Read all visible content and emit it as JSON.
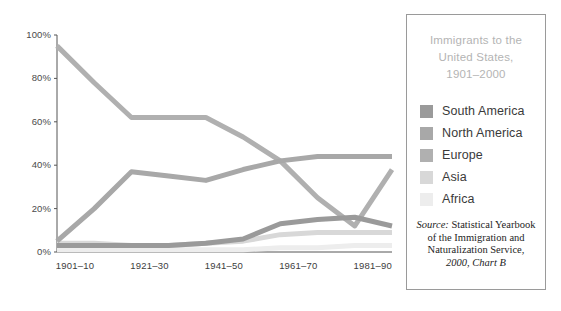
{
  "legend": {
    "title_lines": [
      "Immigrants to the",
      "United States,",
      "1901–2000"
    ],
    "source_prefix": "Source:",
    "source_lines": [
      " Statistical Yearbook",
      "of the Immigration and",
      "Naturalization Service,"
    ],
    "source_last_line": "2000, Chart B"
  },
  "chart_data": {
    "type": "line",
    "title": "Immigrants to the United States, 1901–2000",
    "xlabel": "",
    "ylabel": "",
    "ylim": [
      0,
      100
    ],
    "yticks": [
      "0%",
      "20%",
      "40%",
      "60%",
      "80%",
      "100%"
    ],
    "ytick_values": [
      0,
      20,
      40,
      60,
      80,
      100
    ],
    "grid": false,
    "legend_position": "right",
    "x": [
      "1901–10",
      "1911–20",
      "1921–30",
      "1931–40",
      "1941–50",
      "1951–60",
      "1961–70",
      "1971–80",
      "1981–90",
      "1991–2000"
    ],
    "xtick_labels": [
      "1901–10",
      "1921–30",
      "1941–50",
      "1961–70",
      "1981–90"
    ],
    "xtick_indices": [
      0,
      2,
      4,
      6,
      8
    ],
    "series": [
      {
        "name": "South America",
        "color": "#9a9a9a",
        "values": [
          3,
          3,
          3,
          3,
          4,
          6,
          13,
          15,
          16,
          12
        ]
      },
      {
        "name": "North America",
        "color": "#a8a8a8",
        "values": [
          5,
          20,
          37,
          35,
          33,
          38,
          42,
          44,
          44,
          44
        ]
      },
      {
        "name": "Europe",
        "color": "#b0b0b0",
        "values": [
          95,
          78,
          62,
          62,
          62,
          53,
          42,
          25,
          12,
          38
        ]
      },
      {
        "name": "Asia",
        "color": "#d8d8d8",
        "values": [
          4,
          4,
          3,
          3,
          4,
          5,
          8,
          9,
          9,
          9
        ]
      },
      {
        "name": "Africa",
        "color": "#ededed",
        "values": [
          1,
          1,
          1,
          1,
          1,
          1,
          2,
          2,
          3,
          3
        ]
      }
    ],
    "series_draw_order": [
      "Africa",
      "Asia",
      "Europe",
      "North America",
      "South America"
    ],
    "axis_color": "#555555"
  }
}
